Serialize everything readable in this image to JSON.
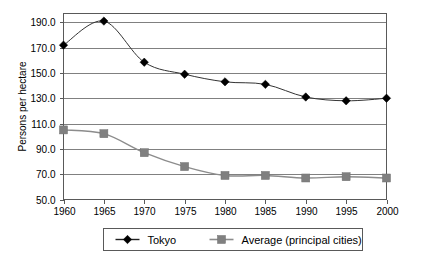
{
  "chart_data": {
    "type": "line",
    "title": "",
    "xlabel": "",
    "ylabel": "Persons per hectare",
    "categories": [
      "1960",
      "1965",
      "1970",
      "1975",
      "1980",
      "1985",
      "1990",
      "1995",
      "2000"
    ],
    "x": [
      1960,
      1965,
      1970,
      1975,
      1980,
      1985,
      1990,
      1995,
      2000
    ],
    "xlim": [
      1960,
      2000
    ],
    "ylim": [
      50.0,
      197.0
    ],
    "yticks": [
      50.0,
      70.0,
      90.0,
      110.0,
      130.0,
      150.0,
      170.0,
      190.0
    ],
    "ytick_labels": [
      "50.0",
      "70.0",
      "90.0",
      "110.0",
      "130.0",
      "150.0",
      "170.0",
      "190.0"
    ],
    "grid": "horizontal",
    "legend_position": "bottom",
    "series": [
      {
        "name": "Tokyo",
        "marker": "diamond",
        "color": "#000000",
        "values": [
          172.0,
          191.0,
          158.5,
          149.0,
          143.0,
          141.0,
          131.0,
          128.0,
          130.0
        ]
      },
      {
        "name": "Average (principal cities)",
        "marker": "square",
        "color": "#808080",
        "values": [
          105.0,
          102.0,
          87.0,
          76.0,
          69.0,
          69.0,
          67.0,
          68.0,
          67.0
        ]
      }
    ]
  },
  "axis": {
    "y_title": "Persons per hectare"
  },
  "legend": {
    "items": [
      {
        "label": "Tokyo"
      },
      {
        "label": "Average (principal cities)"
      }
    ]
  }
}
